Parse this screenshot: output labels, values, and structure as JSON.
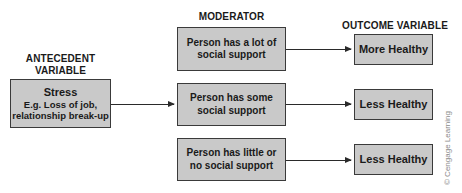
{
  "headings": {
    "antecedent": "ANTECEDENT VARIABLE",
    "antecedent_line1": "ANTECEDENT",
    "antecedent_line2": "VARIABLE",
    "moderator": "MODERATOR",
    "outcome": "OUTCOME VARIABLE"
  },
  "antecedent_box": {
    "title": "Stress",
    "line1": "E.g. Loss of job,",
    "line2": "relationship break-up"
  },
  "moderators": [
    {
      "line1": "Person has a lot of",
      "line2": "social support"
    },
    {
      "line1": "Person has some",
      "line2": "social support"
    },
    {
      "line1": "Person has little or",
      "line2": "no social support"
    }
  ],
  "outcomes": [
    {
      "label": "More Healthy"
    },
    {
      "label": "Less Healthy"
    },
    {
      "label": "Less Healthy"
    }
  ],
  "copyright": "© Cengage Learning",
  "colors": {
    "box_fill": "#c9c9c9",
    "box_border": "#3a3a3a",
    "arrow": "#2a2a2a"
  }
}
